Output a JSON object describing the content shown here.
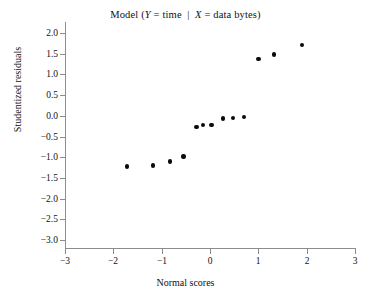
{
  "chart_data": {
    "type": "scatter",
    "title_parts": {
      "prefix": "Model (",
      "y_var": "Y",
      "y_eq": " = time",
      "separator": "|",
      "x_var": "X",
      "x_eq": " = data bytes",
      "suffix": ")"
    },
    "xlabel": "Normal scores",
    "ylabel": "Studentized residuals",
    "xlim": [
      -3,
      3
    ],
    "ylim": [
      -3.0,
      2.0
    ],
    "xticks": [
      -3,
      -2,
      -1,
      0,
      1,
      2,
      3
    ],
    "xtick_labels": [
      "−3",
      "−2",
      "−1",
      "0",
      "1",
      "2",
      "3"
    ],
    "yticks": [
      2.0,
      1.5,
      1.0,
      0.5,
      0.0,
      -0.5,
      -1.0,
      -1.5,
      -2.0,
      -2.5,
      -3.0
    ],
    "ytick_labels": [
      "2.0",
      "1.5",
      "1.0",
      "0.5",
      "0.0",
      "−0.5",
      "−1.0",
      "−1.5",
      "−2.0",
      "−2.5",
      "−3.0"
    ],
    "grid": false,
    "legend": null,
    "marker_color": "#0b0b0b",
    "axis_color": "#8c8c8c",
    "n_points": 13,
    "x": [
      -1.72,
      -1.18,
      -0.83,
      -0.55,
      -0.28,
      -0.14,
      0.03,
      0.27,
      0.47,
      0.7,
      1.0,
      1.32,
      1.9
    ],
    "y": [
      -1.22,
      -1.2,
      -1.1,
      -0.98,
      -0.27,
      -0.22,
      -0.22,
      -0.06,
      -0.05,
      -0.03,
      1.38,
      1.48,
      1.71
    ],
    "points": [
      {
        "x": -1.72,
        "y": -1.22
      },
      {
        "x": -1.18,
        "y": -1.2
      },
      {
        "x": -0.83,
        "y": -1.1
      },
      {
        "x": -0.55,
        "y": -0.98
      },
      {
        "x": -0.28,
        "y": -0.27
      },
      {
        "x": -0.14,
        "y": -0.22
      },
      {
        "x": 0.03,
        "y": -0.22
      },
      {
        "x": 0.27,
        "y": -0.06
      },
      {
        "x": 0.47,
        "y": -0.05
      },
      {
        "x": 0.7,
        "y": -0.03
      },
      {
        "x": 1.0,
        "y": 1.38
      },
      {
        "x": 1.32,
        "y": 1.48
      },
      {
        "x": 1.9,
        "y": 1.71
      }
    ]
  }
}
